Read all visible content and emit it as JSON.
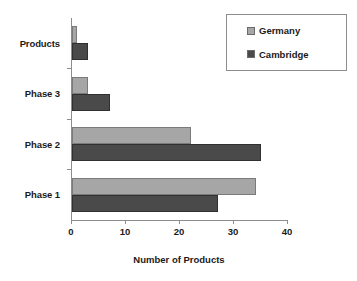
{
  "chart_data": {
    "type": "bar",
    "orientation": "horizontal",
    "title": "",
    "xlabel": "Number of Products",
    "ylabel": "",
    "xlim": [
      0,
      40
    ],
    "xticks": [
      0,
      10,
      20,
      30,
      40
    ],
    "grid": false,
    "legend_position": "top-right",
    "categories": [
      "Phase 1",
      "Phase 2",
      "Phase 3",
      "Products"
    ],
    "series": [
      {
        "name": "Germany",
        "color": "#a6a6a6",
        "values": [
          34,
          22,
          3,
          1
        ]
      },
      {
        "name": "Cambridge",
        "color": "#4a4a4a",
        "values": [
          27,
          35,
          7,
          3
        ]
      }
    ]
  },
  "axis": {
    "x_title": "Number of Products",
    "tick_labels": [
      "0",
      "10",
      "20",
      "30",
      "40"
    ],
    "category_labels": [
      "Products",
      "Phase 3",
      "Phase 2",
      "Phase 1"
    ]
  },
  "legend": {
    "items": [
      {
        "label": "Germany"
      },
      {
        "label": "Cambridge"
      }
    ]
  }
}
